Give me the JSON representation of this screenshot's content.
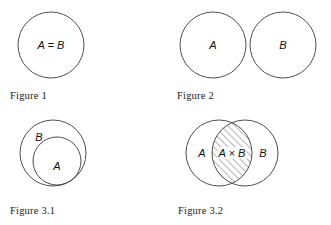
{
  "page": {
    "background_color": "#ffffff",
    "stroke_color": "#3a3a3a",
    "hatch_color": "#4a4a4a",
    "text_color": "#111111"
  },
  "figures": [
    {
      "id": "figure-1",
      "caption": "Figure 1",
      "type": "single-circle-equal-sets",
      "labels": [
        {
          "name": "a-equals-b-label",
          "text": "A = B",
          "cx": 51,
          "cy": 45
        }
      ],
      "circles": [
        {
          "name": "circle-ab",
          "cx": 51,
          "cy": 45,
          "r": 33
        }
      ],
      "caption_pos": {
        "x": 10,
        "y": 90
      }
    },
    {
      "id": "figure-2",
      "caption": "Figure 2",
      "type": "disjoint-sets",
      "labels": [
        {
          "name": "set-a-label",
          "text": "A",
          "cx": 48,
          "cy": 45
        },
        {
          "name": "set-b-label",
          "text": "B",
          "cx": 118,
          "cy": 45
        }
      ],
      "circles": [
        {
          "name": "circle-a",
          "cx": 48,
          "cy": 45,
          "r": 33
        },
        {
          "name": "circle-b",
          "cx": 118,
          "cy": 45,
          "r": 33
        }
      ],
      "caption_pos": {
        "x": 12,
        "y": 90
      }
    },
    {
      "id": "figure-3-1",
      "caption": "Figure 3.1",
      "type": "subset-nested-sets",
      "labels": [
        {
          "name": "set-b-label",
          "text": "B",
          "cx": 39,
          "cy": 24
        },
        {
          "name": "set-a-label",
          "text": "A",
          "cx": 57,
          "cy": 53
        }
      ],
      "circles": [
        {
          "name": "circle-b",
          "cx": 53,
          "cy": 40,
          "r": 33
        },
        {
          "name": "circle-a",
          "cx": 57,
          "cy": 48,
          "r": 24
        }
      ],
      "caption_pos": {
        "x": 10,
        "y": 92
      }
    },
    {
      "id": "figure-3-2",
      "caption": "Figure 3.2",
      "type": "intersecting-sets",
      "labels": [
        {
          "name": "set-a-label",
          "text": "A",
          "cx": 37,
          "cy": 40
        },
        {
          "name": "intersection-label",
          "text": "A × B",
          "cx": 67,
          "cy": 40
        },
        {
          "name": "set-b-label",
          "text": "B",
          "cx": 98,
          "cy": 40
        }
      ],
      "circles": [
        {
          "name": "circle-a",
          "cx": 54,
          "cy": 40,
          "r": 33
        },
        {
          "name": "circle-b",
          "cx": 80,
          "cy": 40,
          "r": 33
        }
      ],
      "intersection": {
        "name": "intersection-region",
        "hatched": true,
        "hatch_angle_deg": 45
      },
      "caption_pos": {
        "x": 13,
        "y": 92
      }
    }
  ]
}
